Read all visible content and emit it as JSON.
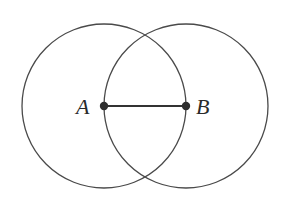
{
  "diagram": {
    "type": "geometric-construction",
    "colors": {
      "stroke": "#4a4a4a",
      "point": "#2e2e2e",
      "label": "#2a2a2a",
      "background": "#ffffff"
    },
    "points": [
      {
        "id": "A",
        "label": "A",
        "x": 104,
        "y": 106
      },
      {
        "id": "B",
        "label": "B",
        "x": 186,
        "y": 106
      }
    ],
    "circles": [
      {
        "center": "A",
        "cx": 104,
        "cy": 106,
        "r": 82
      },
      {
        "center": "B",
        "cx": 186,
        "cy": 106,
        "r": 82
      }
    ],
    "segments": [
      {
        "from": "A",
        "to": "B"
      }
    ]
  }
}
